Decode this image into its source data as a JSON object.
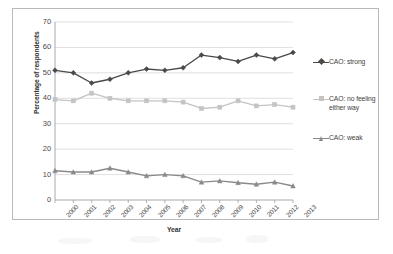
{
  "chart_data": {
    "type": "line",
    "title": "",
    "xlabel": "Year",
    "ylabel": "Percentage of respondents",
    "categories": [
      "2000",
      "2001",
      "2002",
      "2003",
      "2004",
      "2005",
      "2006",
      "2007",
      "2008",
      "2009",
      "2010",
      "2011",
      "2012",
      "2013"
    ],
    "ylim": [
      0,
      70
    ],
    "ytick_step": 10,
    "yticks": [
      "0",
      "10",
      "20",
      "30",
      "40",
      "50",
      "60",
      "70"
    ],
    "grid": "horizontal",
    "legend_position": "right",
    "series": [
      {
        "name": "CAO: strong",
        "color": "#4a4a4a",
        "marker": "diamond",
        "values": [
          51,
          50,
          46,
          47.5,
          50,
          51.5,
          51,
          52,
          57,
          56,
          54.5,
          57,
          55.5,
          58
        ]
      },
      {
        "name": "CAO: no feeling either way",
        "color": "#c4c4c4",
        "marker": "square",
        "values": [
          39.5,
          39,
          42,
          40,
          39,
          39,
          39,
          38.5,
          36,
          36.5,
          39,
          37,
          37.5,
          36.5
        ]
      },
      {
        "name": "CAO: weak",
        "color": "#8a8a8a",
        "marker": "triangle",
        "values": [
          11.5,
          11,
          11,
          12.5,
          11,
          9.5,
          10,
          9.5,
          7,
          7.5,
          6.8,
          6.2,
          7,
          5.5
        ]
      }
    ]
  },
  "legend": {
    "items": [
      {
        "label": "CAO: strong"
      },
      {
        "label": "CAO: no feeling either way"
      },
      {
        "label": "CAO: weak"
      }
    ]
  },
  "colors": {
    "strong": "#4a4a4a",
    "no_feeling": "#c4c4c4",
    "weak": "#8a8a8a",
    "axis": "#a0a0a0",
    "grid": "#d7d7d7",
    "frame": "#b9b9b9"
  }
}
